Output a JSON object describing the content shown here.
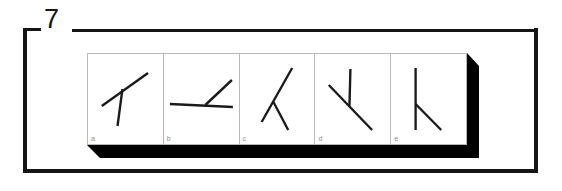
{
  "figure": {
    "number": "7",
    "frame_color": "#151515",
    "panel_border_color": "#b9b9b9",
    "panel_background": "#ffffff",
    "shadow_color": "#000000",
    "stroke_color": "#1a1a1a",
    "label_color": "#8d8d8d"
  },
  "panels": [
    {
      "label": "a",
      "name": "panel-a",
      "strokes": [
        {
          "name": "long-stroke",
          "x1": 14,
          "y1": 52,
          "x2": 61,
          "y2": 19,
          "width": 2.4
        },
        {
          "name": "short-stroke",
          "x1": 35,
          "y1": 35,
          "x2": 30,
          "y2": 72,
          "width": 2.4
        }
      ]
    },
    {
      "label": "b",
      "name": "panel-b",
      "strokes": [
        {
          "name": "long-stroke",
          "x1": 6,
          "y1": 50,
          "x2": 70,
          "y2": 53,
          "width": 2.4
        },
        {
          "name": "short-stroke",
          "x1": 42,
          "y1": 51,
          "x2": 69,
          "y2": 26,
          "width": 2.4
        }
      ]
    },
    {
      "label": "c",
      "name": "panel-c",
      "strokes": [
        {
          "name": "long-stroke",
          "x1": 22,
          "y1": 68,
          "x2": 53,
          "y2": 14,
          "width": 2.4
        },
        {
          "name": "short-stroke",
          "x1": 34,
          "y1": 48,
          "x2": 49,
          "y2": 76,
          "width": 2.4
        }
      ]
    },
    {
      "label": "d",
      "name": "panel-d",
      "strokes": [
        {
          "name": "long-stroke",
          "x1": 14,
          "y1": 31,
          "x2": 58,
          "y2": 76,
          "width": 2.4
        },
        {
          "name": "short-stroke",
          "x1": 35,
          "y1": 52,
          "x2": 36,
          "y2": 15,
          "width": 2.4
        }
      ]
    },
    {
      "label": "e",
      "name": "panel-e",
      "strokes": [
        {
          "name": "long-stroke",
          "x1": 25,
          "y1": 14,
          "x2": 25,
          "y2": 76,
          "width": 2.4
        },
        {
          "name": "short-stroke",
          "x1": 25,
          "y1": 50,
          "x2": 51,
          "y2": 76,
          "width": 2.4
        }
      ]
    }
  ]
}
